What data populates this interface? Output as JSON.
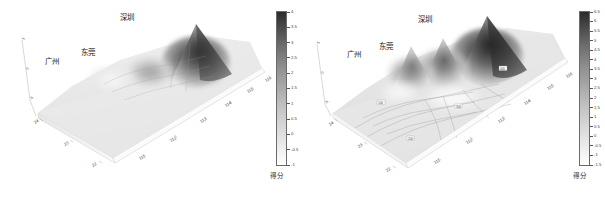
{
  "figure": {
    "background_color": "#ffffff",
    "panel_count": 2
  },
  "panels": [
    {
      "id": "panel-left",
      "name": "left-surface-plot",
      "city_labels": [
        {
          "name": "guangzhou",
          "text": "广州",
          "x": 45,
          "y": 60
        },
        {
          "name": "dongguan",
          "text": "东莞",
          "x": 80,
          "y": 52
        },
        {
          "name": "shenzhen",
          "text": "深圳",
          "x": 119,
          "y": 14
        }
      ],
      "x_axis": {
        "name": "longitude-axis",
        "ticks": [
          "111",
          "112",
          "113",
          "114",
          "115",
          "116"
        ]
      },
      "y_axis": {
        "name": "latitude-axis",
        "ticks": [
          "24",
          "23",
          "22"
        ]
      },
      "colorbar": {
        "title": "得分",
        "ticks": [
          "4",
          "3.5",
          "3",
          "2.5",
          "2",
          "1.5",
          "1",
          "0.5",
          "0",
          "-0.5",
          "-1"
        ],
        "min": -1,
        "max": 4,
        "colormap": "grayscale-inverted"
      }
    },
    {
      "id": "panel-right",
      "name": "right-surface-plot",
      "city_labels": [
        {
          "name": "guangzhou",
          "text": "广州",
          "x": 47,
          "y": 53
        },
        {
          "name": "dongguan",
          "text": "东莞",
          "x": 78,
          "y": 45
        },
        {
          "name": "shenzhen",
          "text": "深圳",
          "x": 116,
          "y": 19
        }
      ],
      "x_axis": {
        "name": "longitude-axis",
        "ticks": [
          "111",
          "112",
          "113",
          "114",
          "115",
          "116"
        ]
      },
      "y_axis": {
        "name": "latitude-axis",
        "ticks": [
          "24",
          "23",
          "22"
        ]
      },
      "colorbar": {
        "title": "得分",
        "ticks": [
          "6.5",
          "6",
          "5.5",
          "5",
          "4.5",
          "4",
          "3.5",
          "3",
          "2.5",
          "2",
          "1.5",
          "1",
          "0.5",
          "0",
          "-0.5",
          "-1",
          "-1.5"
        ],
        "min": -1.5,
        "max": 6.5,
        "colormap": "grayscale-inverted"
      }
    }
  ],
  "chart_data": {
    "type": "heatmap",
    "title": "",
    "subtitle": "",
    "xlabel": "经度",
    "ylabel": "纬度",
    "zlabel": "得分",
    "grid": false,
    "legend_position": "right",
    "projection": "3d-surface",
    "charts": [
      {
        "name": "left-surface-plot",
        "type": "surface",
        "xlim": [
          110.5,
          116.5
        ],
        "ylim": [
          21.5,
          24.5
        ],
        "zlim": [
          -1,
          4
        ],
        "colorbar_label": "得分",
        "colorbar_ticks": [
          4,
          3.5,
          3,
          2.5,
          2,
          1.5,
          1,
          0.5,
          0,
          -0.5,
          -1
        ],
        "x_ticks": [
          111,
          112,
          113,
          114,
          115,
          116
        ],
        "y_ticks": [
          24,
          23,
          22
        ],
        "annotations": [
          "广州",
          "东莞",
          "深圳"
        ],
        "peaks": [
          {
            "label": "深圳",
            "lon": 114.05,
            "lat": 22.55,
            "value": 4.0
          },
          {
            "label": "东莞",
            "lon": 113.75,
            "lat": 23.02,
            "value": 1.6
          },
          {
            "label": "广州",
            "lon": 113.26,
            "lat": 23.13,
            "value": 1.2
          }
        ],
        "baseline_value": -0.4
      },
      {
        "name": "right-surface-plot",
        "type": "surface",
        "xlim": [
          110.5,
          116.5
        ],
        "ylim": [
          21.5,
          24.5
        ],
        "zlim": [
          -1.5,
          6.5
        ],
        "colorbar_label": "得分",
        "colorbar_ticks": [
          6.5,
          6,
          5.5,
          5,
          4.5,
          4,
          3.5,
          3,
          2.5,
          2,
          1.5,
          1,
          0.5,
          0,
          -0.5,
          -1,
          -1.5
        ],
        "x_ticks": [
          111,
          112,
          113,
          114,
          115,
          116
        ],
        "y_ticks": [
          24,
          23,
          22
        ],
        "annotations": [
          "广州",
          "东莞",
          "深圳"
        ],
        "peaks": [
          {
            "label": "深圳",
            "lon": 114.05,
            "lat": 22.55,
            "value": 6.5
          },
          {
            "label": "东莞",
            "lon": 113.75,
            "lat": 23.02,
            "value": 3.5
          },
          {
            "label": "广州",
            "lon": 113.26,
            "lat": 23.13,
            "value": 3.0
          }
        ],
        "baseline_value": -1.0,
        "contours": true
      }
    ]
  }
}
